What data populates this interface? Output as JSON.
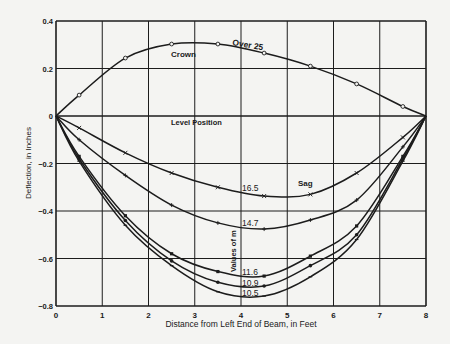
{
  "chart_data": {
    "type": "line",
    "title": "",
    "xlabel": "Distance from Left End of Beam, in Feet",
    "ylabel": "Deflection, in Inches",
    "xlim": [
      0,
      8
    ],
    "ylim": [
      -0.8,
      0.4
    ],
    "x_ticks": [
      "0",
      "1",
      "2",
      "3",
      "4",
      "5",
      "6",
      "7",
      "8"
    ],
    "y_ticks": [
      "0.4",
      "0.2",
      "0",
      "-0.2",
      "-0.4",
      "-0.6",
      "-0.8"
    ],
    "grid": true,
    "legend": null,
    "annotations": {
      "crown": "Crown",
      "over25": "Over 25",
      "level_position": "Level Position",
      "sag": "Sag",
      "values_of_m": "Values of m",
      "m_16_5": "16.5",
      "m_14_7": "14.7",
      "m_11_6": "11.6",
      "m_10_9": "10.9",
      "m_10_5": "10.5"
    },
    "x": [
      0,
      0.5,
      1.5,
      2.5,
      3.5,
      4.5,
      5.5,
      6.5,
      7.5,
      8
    ],
    "series": [
      {
        "name": "Over 25 (Crown)",
        "marker": "circle",
        "values": [
          0,
          0.088,
          0.244,
          0.303,
          0.303,
          0.265,
          0.21,
          0.135,
          0.04,
          0
        ]
      },
      {
        "name": "16.5",
        "marker": "x",
        "values": [
          0,
          -0.05,
          -0.155,
          -0.24,
          -0.3,
          -0.337,
          -0.33,
          -0.24,
          -0.09,
          0
        ]
      },
      {
        "name": "14.7",
        "marker": "plus",
        "values": [
          0,
          -0.1,
          -0.25,
          -0.375,
          -0.45,
          -0.476,
          -0.438,
          -0.354,
          -0.13,
          0
        ]
      },
      {
        "name": "11.6",
        "marker": "square",
        "values": [
          0,
          -0.17,
          -0.42,
          -0.58,
          -0.655,
          -0.674,
          -0.59,
          -0.463,
          -0.17,
          0
        ]
      },
      {
        "name": "10.9",
        "marker": "dot",
        "values": [
          0,
          -0.18,
          -0.44,
          -0.61,
          -0.7,
          -0.716,
          -0.63,
          -0.5,
          -0.18,
          0
        ]
      },
      {
        "name": "10.5",
        "marker": "dash",
        "values": [
          0,
          -0.19,
          -0.46,
          -0.63,
          -0.74,
          -0.758,
          -0.677,
          -0.52,
          -0.19,
          0
        ]
      }
    ]
  }
}
